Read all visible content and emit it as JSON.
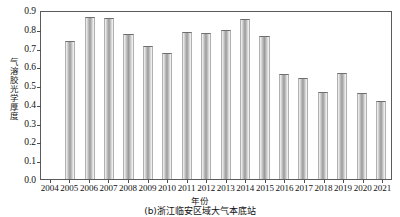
{
  "chart_data": {
    "type": "bar",
    "title": "",
    "caption": "(b)浙江临安区域大气本底站",
    "xlabel": "年份",
    "ylabel": "气溶胶光学厚度",
    "ylim": [
      0.0,
      0.9
    ],
    "grid": false,
    "legend": null,
    "ytick_labels": [
      "0.9",
      "0.8",
      "0.7",
      "0.6",
      "0.5",
      "0.4",
      "0.3",
      "0.2",
      "0.1",
      "0.0"
    ],
    "ytick_values": [
      0.9,
      0.8,
      0.7,
      0.6,
      0.5,
      0.4,
      0.3,
      0.2,
      0.1,
      0.0
    ],
    "categories": [
      "2004",
      "2005",
      "2006",
      "2007",
      "2008",
      "2009",
      "2010",
      "2011",
      "2012",
      "2013",
      "2014",
      "2015",
      "2016",
      "2017",
      "2018",
      "2019",
      "2020",
      "2021"
    ],
    "values": [
      null,
      0.735,
      0.862,
      0.855,
      0.772,
      0.706,
      0.672,
      0.784,
      0.778,
      0.796,
      0.853,
      0.761,
      0.557,
      0.537,
      0.466,
      0.564,
      0.458,
      0.417
    ],
    "bar_color": "#b4b4b4",
    "bar_edge_color": "#6e6e6e",
    "axis_color": "#5b5b5b"
  }
}
